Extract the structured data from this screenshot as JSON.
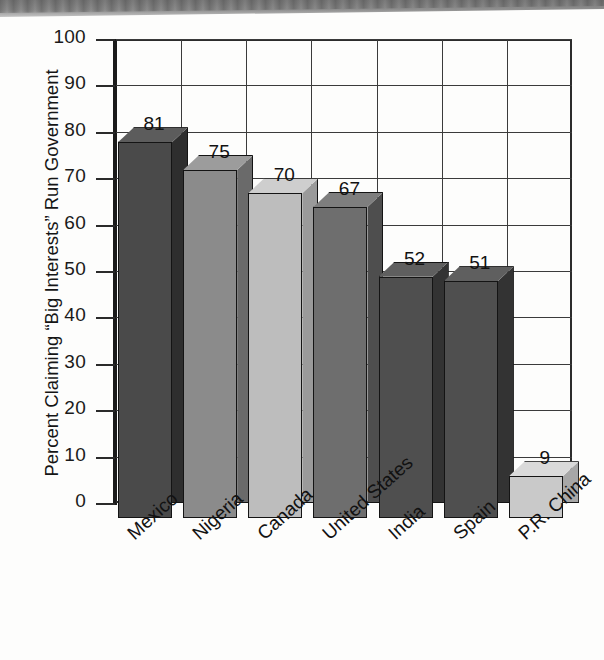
{
  "chart_data": {
    "type": "bar",
    "title": "",
    "subtitle": "",
    "xlabel": "",
    "ylabel": "Percent Claiming “Big Interests” Run Government",
    "ylim": [
      0,
      100
    ],
    "ytick_step": 10,
    "yticks": [
      "100",
      "90",
      "80",
      "70",
      "60",
      "50",
      "40",
      "30",
      "20",
      "10",
      "0"
    ],
    "grid": true,
    "grid_orientation": "both",
    "legend": false,
    "legend_position": "none",
    "style": "3d-bar",
    "categories": [
      "Mexico",
      "Nigeria",
      "Canada",
      "United States",
      "India",
      "Spain",
      "P.R. China"
    ],
    "values": [
      81,
      75,
      70,
      67,
      52,
      51,
      9
    ],
    "value_labels": [
      "81",
      "75",
      "70",
      "67",
      "52",
      "51",
      "9"
    ],
    "bar_colors": [
      "#4a4a4a",
      "#8b8b8b",
      "#bdbdbd",
      "#6e6e6e",
      "#4f4f4f",
      "#4f4f4f",
      "#c9c9c9"
    ],
    "bar_side_colors": [
      "#2e2e2e",
      "#6a6a6a",
      "#9a9a9a",
      "#4e4e4e",
      "#333333",
      "#333333",
      "#a7a7a7"
    ],
    "bar_top_colors": [
      "#5c5c5c",
      "#9c9c9c",
      "#cecece",
      "#7e7e7e",
      "#5f5f5f",
      "#5f5f5f",
      "#dadada"
    ],
    "outline_color": "#141414",
    "axis_color": "#1b1b1b",
    "grid_color": "#3b3b3b",
    "background": "#fdfdfc"
  }
}
